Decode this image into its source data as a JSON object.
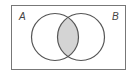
{
  "diagram": {
    "type": "venn",
    "sets": [
      {
        "label": "A",
        "cx": 55,
        "cy": 37,
        "r": 23.5
      },
      {
        "label": "B",
        "cx": 81,
        "cy": 37,
        "r": 23.5
      }
    ],
    "shaded_region": "A ∩ B",
    "colors": {
      "stroke": "#555555",
      "shade": "#d4d4d4",
      "frame": "#777777"
    }
  }
}
